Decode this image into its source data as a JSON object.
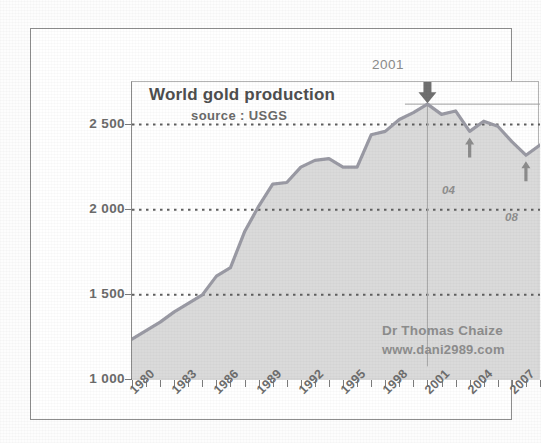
{
  "chart_data": {
    "type": "area",
    "title": "World gold production",
    "subtitle": "source : USGS",
    "xlabel": "",
    "ylabel": "",
    "ylim": [
      1000,
      2750
    ],
    "xlim": [
      1980,
      2009
    ],
    "grid": true,
    "legend": null,
    "y_ticks": [
      "1 000",
      "1 500",
      "2 000",
      "2 500"
    ],
    "y_tick_values": [
      1000,
      1500,
      2000,
      2500
    ],
    "x_ticks": [
      "1980",
      "1983",
      "1986",
      "1989",
      "1992",
      "1995",
      "1998",
      "2001",
      "2004",
      "2007"
    ],
    "x_tick_values": [
      1980,
      1983,
      1986,
      1989,
      1992,
      1995,
      1998,
      2001,
      2004,
      2007
    ],
    "x_minor_tick_values": [
      1980,
      1981,
      1982,
      1983,
      1984,
      1985,
      1986,
      1987,
      1988,
      1989,
      1990,
      1991,
      1992,
      1993,
      1994,
      1995,
      1996,
      1997,
      1998,
      1999,
      2000,
      2001,
      2002,
      2003,
      2004,
      2005,
      2006,
      2007,
      2008,
      2009
    ],
    "series": [
      {
        "name": "World gold production",
        "x": [
          1980,
          1981,
          1982,
          1983,
          1984,
          1985,
          1986,
          1987,
          1988,
          1989,
          1990,
          1991,
          1992,
          1993,
          1994,
          1995,
          1996,
          1997,
          1998,
          1999,
          2000,
          2001,
          2002,
          2003,
          2004,
          2005,
          2006,
          2007,
          2008,
          2009
        ],
        "values": [
          1240,
          1290,
          1340,
          1400,
          1450,
          1500,
          1610,
          1660,
          1870,
          2020,
          2150,
          2160,
          2250,
          2290,
          2300,
          2250,
          2250,
          2440,
          2460,
          2530,
          2570,
          2620,
          2560,
          2580,
          2460,
          2520,
          2490,
          2400,
          2320,
          2380
        ]
      }
    ],
    "annotations": [
      {
        "text": "2001",
        "x": 2001,
        "y": 2620,
        "marker": "down-arrow",
        "note": "peak of world gold production"
      },
      {
        "text": "04",
        "x": 2004,
        "y": 2460,
        "marker": "up-arrow",
        "note": "local minimum 2004"
      },
      {
        "text": "08",
        "x": 2008,
        "y": 2320,
        "marker": "up-arrow",
        "note": "local minimum 2008"
      }
    ],
    "reference_line": {
      "orientation": "horizontal",
      "y": 2620,
      "label": "2001 peak level"
    },
    "vertical_line": {
      "orientation": "vertical",
      "x": 2001
    }
  },
  "credit": {
    "name": "Dr Thomas Chaize",
    "url": "www.dani2989.com"
  },
  "colors": {
    "line": "#9a9aa4",
    "area_fill": "#d8d8d8",
    "grid": "#5f5f5f",
    "axis": "#7a7a7a",
    "text": "#6b6b6b",
    "title": "#4e4e4e",
    "background": "#ffffff",
    "frame": "#8d8d8d"
  }
}
